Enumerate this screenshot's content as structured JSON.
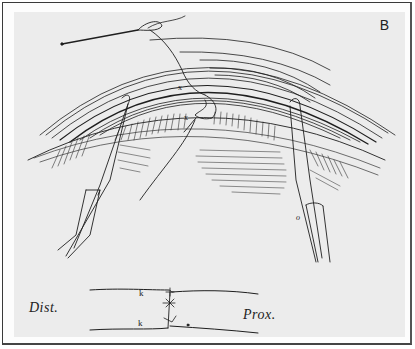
{
  "figure": {
    "panel_label": "B",
    "colors": {
      "paper": "#ececec",
      "ink": "#1e1e1e",
      "frame": "#3a3a3a"
    },
    "illustration": {
      "subject": "surgical-repair-drawing",
      "marks": [
        "x",
        "x",
        "o"
      ]
    },
    "schematic": {
      "left_label": "Dist.",
      "right_label": "Prox.",
      "marks": [
        "k",
        "k",
        "*",
        "*"
      ]
    }
  }
}
